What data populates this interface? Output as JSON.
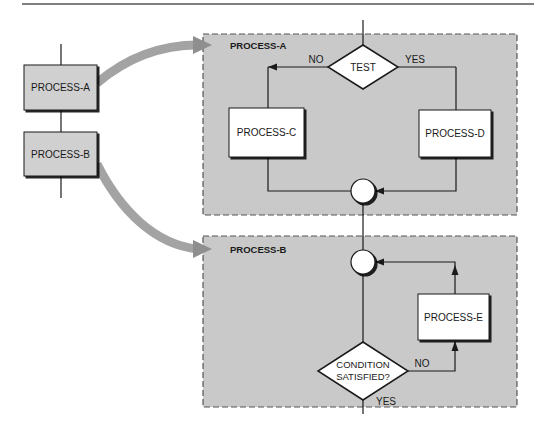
{
  "figure": {
    "outer_flow": {
      "steps": [
        {
          "id": "outer-a",
          "label": "PROCESS-A"
        },
        {
          "id": "outer-b",
          "label": "PROCESS-B"
        }
      ]
    },
    "expansion_a": {
      "title": "PROCESS-A",
      "decision": {
        "label": "TEST",
        "no_label": "NO",
        "yes_label": "YES"
      },
      "branch_no": {
        "label": "PROCESS-C"
      },
      "branch_yes": {
        "label": "PROCESS-D"
      }
    },
    "expansion_b": {
      "title": "PROCESS-B",
      "loop_body": {
        "label": "PROCESS-E"
      },
      "decision": {
        "line1": "CONDITION",
        "line2": "SATISFIED?",
        "no_label": "NO",
        "yes_label": "YES"
      }
    },
    "colors": {
      "panel_fill": "#c9c9c9",
      "box_fill_outer": "#d0d0d0",
      "box_fill_inner": "#ffffff",
      "arrow_gray": "#a3a3a3",
      "line": "#1a1a1a"
    }
  }
}
